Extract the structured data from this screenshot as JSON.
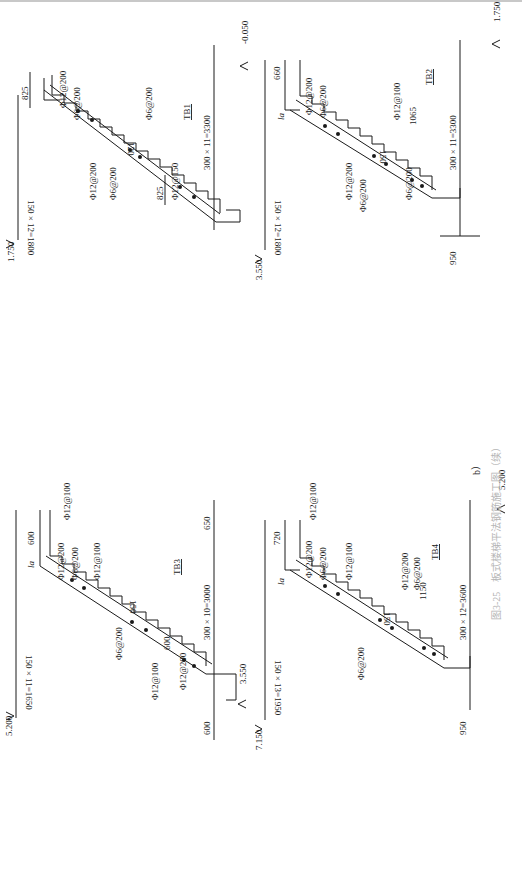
{
  "figure": {
    "sub_label": "b）",
    "caption": "图3-25　板式楼梯平法钢筋施工图（续）",
    "orientation": "rotated 90° clockwise"
  },
  "stairs": [
    {
      "id": "TB1",
      "label": "TB1",
      "elev_low": "1.750",
      "elev_high": "-0.050",
      "rise_dim": "150 × 12=1800",
      "run_dim": "300 × 11=3300",
      "end_dim_left": "825",
      "end_dim_right": "825",
      "thickness": "120",
      "rebar": [
        "Φ12@200",
        "Φ6@200",
        "Φ6@200",
        "Φ12@150",
        "Φ6@200",
        "Φ12@200"
      ]
    },
    {
      "id": "TB2",
      "label": "TB2",
      "elev_low": "3.550",
      "elev_high": "1.750",
      "rise_dim": "150 × 12=1800",
      "run_dim": "300 × 11=3300",
      "landing_dim": "950",
      "end_dim_left": "660",
      "end_dim_right": "1065",
      "la_label": "la",
      "thickness": "150",
      "rebar": [
        "Φ12@200",
        "Φ6@200",
        "Φ12@100",
        "Φ6@200",
        "Φ12@200",
        "Φ6@200"
      ]
    },
    {
      "id": "TB3",
      "label": "TB3",
      "elev_low": "5.200",
      "elev_high": "3.550",
      "rise_dim": "150 × 11=1650",
      "run_dim": "300 × 10=3000",
      "landing_dim_left": "650",
      "landing_dim_right": "600",
      "end_dim_left": "600",
      "end_dim_right": "600",
      "la_label": "la",
      "thickness": "150",
      "rebar": [
        "Φ12@100",
        "Φ12@200",
        "Φ6@200",
        "Φ12@100",
        "Φ6@200",
        "Φ12@200",
        "Φ12@100"
      ]
    },
    {
      "id": "TB4",
      "label": "TB4",
      "elev_low": "7.150",
      "elev_high": "5.200",
      "rise_dim": "150 × 13=1950",
      "run_dim": "300 × 12=3600",
      "landing_dim": "950",
      "end_dim_left": "720",
      "end_dim_right": "1150",
      "la_label": "la",
      "thickness": "150",
      "rebar": [
        "Φ12@100",
        "Φ12@200",
        "Φ6@200",
        "Φ12@100",
        "Φ6@200",
        "Φ12@200",
        "Φ6@200"
      ]
    }
  ]
}
